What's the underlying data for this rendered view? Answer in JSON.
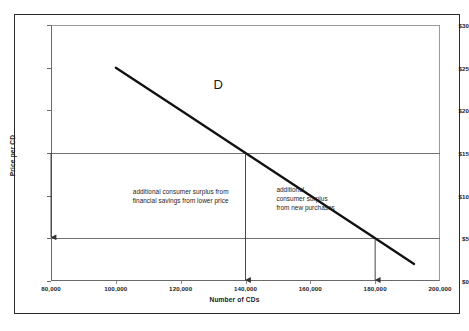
{
  "chart_data": {
    "type": "line",
    "title": "",
    "xlabel": "Number of CDs",
    "ylabel": "Price per CD",
    "xlim": [
      80000,
      200000
    ],
    "ylim": [
      0,
      30
    ],
    "grid": false,
    "legend": "none",
    "series": [
      {
        "name": "D",
        "label": "D",
        "points": [
          {
            "x": 100000,
            "y": 25
          },
          {
            "x": 120000,
            "y": 20
          },
          {
            "x": 140000,
            "y": 15
          },
          {
            "x": 180000,
            "y": 5
          },
          {
            "x": 192000,
            "y": 2
          }
        ]
      }
    ],
    "reference_lines": [
      {
        "type": "horizontal",
        "value": 15,
        "label": "$15"
      },
      {
        "type": "horizontal",
        "value": 5,
        "label": "$5"
      }
    ],
    "annotations": [
      {
        "name": "demand-curve-label",
        "text": "D",
        "x": 132000,
        "y": 23
      },
      {
        "name": "surplus-note-left",
        "text": "additional consumer surplus from\nfinancial savings from lower price",
        "x": 120000,
        "y": 10
      },
      {
        "name": "surplus-note-right",
        "text": "additional\nconsumer surplus\nfrom new purchases",
        "x": 152000,
        "y": 10
      }
    ],
    "arrows": [
      {
        "name": "price-drop-arrow",
        "from": {
          "x": 80000,
          "y": 15
        },
        "to": {
          "x": 80000,
          "y": 5
        }
      },
      {
        "name": "quantity-arrow-140k",
        "from": {
          "x": 140000,
          "y": 15
        },
        "to": {
          "x": 140000,
          "y": 0
        }
      },
      {
        "name": "quantity-arrow-180k",
        "from": {
          "x": 180000,
          "y": 5
        },
        "to": {
          "x": 180000,
          "y": 0
        }
      }
    ],
    "y_ticks": [
      {
        "value": 0,
        "label": "$0"
      },
      {
        "value": 5,
        "label": "$5"
      },
      {
        "value": 10,
        "label": "$10"
      },
      {
        "value": 15,
        "label": "$15"
      },
      {
        "value": 20,
        "label": "$20"
      },
      {
        "value": 25,
        "label": "$25"
      },
      {
        "value": 30,
        "label": "$30"
      }
    ],
    "x_ticks": [
      {
        "value": 80000,
        "label": "80,000"
      },
      {
        "value": 100000,
        "label": "100,000"
      },
      {
        "value": 120000,
        "label": "120,000"
      },
      {
        "value": 140000,
        "label": "140,000"
      },
      {
        "value": 160000,
        "label": "160,000"
      },
      {
        "value": 180000,
        "label": "180,000"
      },
      {
        "value": 200000,
        "label": "200,000"
      }
    ],
    "colors": {
      "curve": "#111111",
      "axis": "#6f6f6f",
      "text": "#1a1a1a",
      "frame": "#2b2b2b",
      "background": "#ffffff"
    }
  }
}
